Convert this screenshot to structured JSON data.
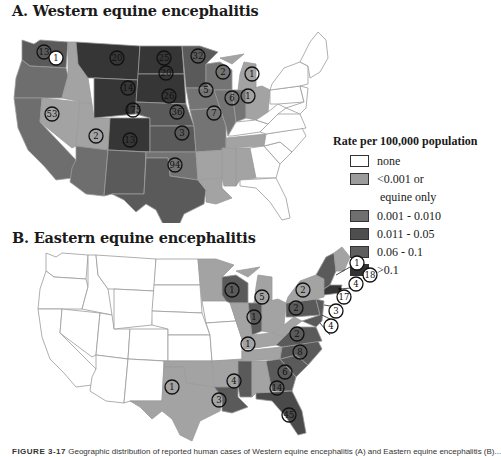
{
  "figure": {
    "panel_a_title": "A. Western equine encephalitis",
    "panel_b_title": "B. Eastern equine encephalitis",
    "caption_label": "FIGURE 3-17",
    "caption_text": "Geographic distribution of reported human cases of Western equine encephalitis (A) and Eastern equine encephalitis (B)..."
  },
  "legend": {
    "title": "Rate per 100,000 population",
    "items": [
      {
        "label": "none",
        "color": "#ffffff"
      },
      {
        "label": "<0.001 or",
        "label2": "equine only",
        "color": "#9c9c9c"
      },
      {
        "label": "0.001 - 0.010",
        "color": "#6f6f6f"
      },
      {
        "label": "0.011 - 0.05",
        "color": "#4e4e4e"
      },
      {
        "label": "0.06 - 0.1",
        "color": "#5e5e5e"
      },
      {
        "label": ">0.1",
        "color": "#333333"
      }
    ]
  },
  "colors": {
    "none": "#ffffff",
    "low": "#a3a3a3",
    "mid": "#747474",
    "midhigh": "#5a5a5a",
    "high": "#4a4a4a",
    "top": "#363636",
    "border": "#9a9a9a"
  },
  "map_a": {
    "case_counts": [
      {
        "state": "WA",
        "value": "13"
      },
      {
        "state": "OR",
        "value": "1",
        "style": "white"
      },
      {
        "state": "CA",
        "value": "53"
      },
      {
        "state": "MT",
        "value": "20"
      },
      {
        "state": "ND",
        "value": "25"
      },
      {
        "state": "MN",
        "value": "32"
      },
      {
        "state": "WY",
        "value": "14"
      },
      {
        "state": "SD",
        "value": "20"
      },
      {
        "state": "WI",
        "value": "2"
      },
      {
        "state": "MI",
        "value": "1"
      },
      {
        "state": "NE",
        "value": "26"
      },
      {
        "state": "IA",
        "value": "5"
      },
      {
        "state": "IL",
        "value": "6"
      },
      {
        "state": "IN",
        "value": "1"
      },
      {
        "state": "CO",
        "value": "175"
      },
      {
        "state": "KS",
        "value": "36"
      },
      {
        "state": "MO",
        "value": "7"
      },
      {
        "state": "AZ",
        "value": "2"
      },
      {
        "state": "NM",
        "value": "13"
      },
      {
        "state": "OK",
        "value": "3"
      },
      {
        "state": "TX",
        "value": "94"
      }
    ]
  },
  "map_b": {
    "case_counts": [
      {
        "state": "WI",
        "value": "1"
      },
      {
        "state": "MI",
        "value": "5"
      },
      {
        "state": "IN",
        "value": "1"
      },
      {
        "state": "NY",
        "value": "2"
      },
      {
        "state": "PA",
        "value": "2"
      },
      {
        "state": "MD",
        "value": "2"
      },
      {
        "state": "VA",
        "value": "8"
      },
      {
        "state": "KY",
        "value": "1"
      },
      {
        "state": "NC",
        "value": "6"
      },
      {
        "state": "GA",
        "value": "14"
      },
      {
        "state": "FL",
        "value": "45"
      },
      {
        "state": "MS",
        "value": "4"
      },
      {
        "state": "LA",
        "value": "3"
      },
      {
        "state": "TX",
        "value": "1"
      },
      {
        "state": "NH",
        "value": "1",
        "style": "white"
      },
      {
        "state": "MA",
        "value": "18",
        "style": "white"
      },
      {
        "state": "RI",
        "value": "4",
        "style": "white"
      },
      {
        "state": "NJ",
        "value": "17",
        "style": "white"
      },
      {
        "state": "DE",
        "value": "3",
        "style": "white"
      },
      {
        "state": "MD-callout",
        "value": "4",
        "style": "white"
      }
    ]
  }
}
